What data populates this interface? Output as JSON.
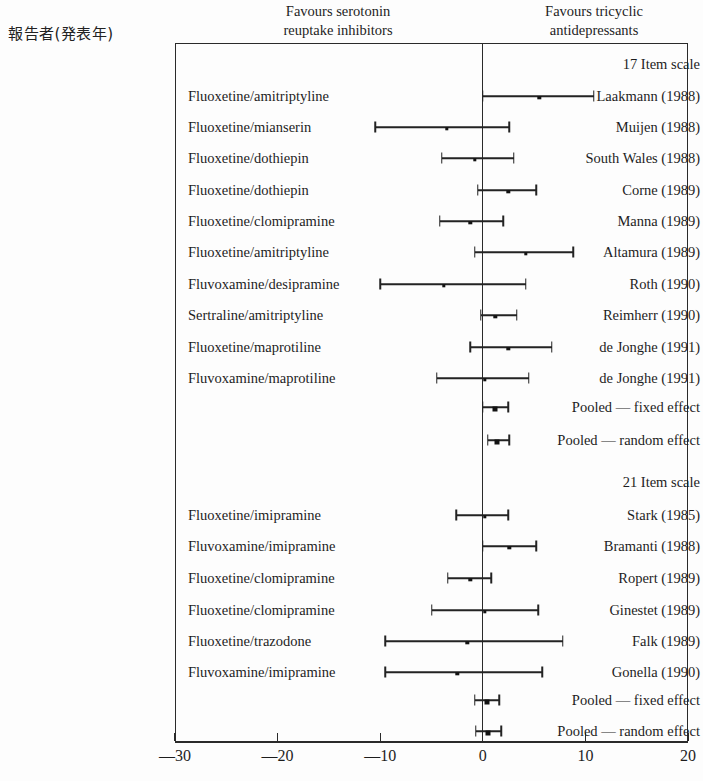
{
  "header": {
    "left_column_title": "報告者(発表年)",
    "favours_left": "Favours serotonin\nreuptake inhibitors",
    "favours_right": "Favours tricyclic\nantidepressants"
  },
  "axis": {
    "ticks": [
      -30,
      -20,
      -10,
      0,
      10,
      20
    ],
    "tick_labels": [
      "—30",
      "—20",
      "—10",
      "0",
      "10",
      "20"
    ],
    "min": -30,
    "max": 20
  },
  "chart_data": {
    "type": "forest",
    "title": "",
    "xlabel": "",
    "ylabel": "",
    "xlim": [
      -30,
      20
    ],
    "grid": false,
    "legend": "none",
    "annotations": {
      "left_side": "Favours serotonin reuptake inhibitors",
      "right_side": "Favours tricyclic antidepressants",
      "reference_line": 0
    },
    "groups": [
      {
        "group_label": "17 Item scale",
        "rows": [
          {
            "study": "Laakmann (1988)",
            "comparison": "Fluoxetine/amitriptyline",
            "estimate": 5.5,
            "ci_low": 0.0,
            "ci_high": 10.8,
            "kind": "study"
          },
          {
            "study": "Muijen (1988)",
            "comparison": "Fluoxetine/mianserin",
            "estimate": -3.5,
            "ci_low": -10.5,
            "ci_high": 2.6,
            "kind": "study"
          },
          {
            "study": "South Wales (1988)",
            "comparison": "Fluoxetine/dothiepin",
            "estimate": -0.8,
            "ci_low": -4.0,
            "ci_high": 3.0,
            "kind": "study"
          },
          {
            "study": "Corne (1989)",
            "comparison": "Fluoxetine/dothiepin",
            "estimate": 2.5,
            "ci_low": -0.5,
            "ci_high": 5.2,
            "kind": "study"
          },
          {
            "study": "Manna (1989)",
            "comparison": "Fluoxetine/clomipramine",
            "estimate": -1.2,
            "ci_low": -4.2,
            "ci_high": 2.0,
            "kind": "study"
          },
          {
            "study": "Altamura (1989)",
            "comparison": "Fluoxetine/amitriptyline",
            "estimate": 4.2,
            "ci_low": -0.8,
            "ci_high": 8.8,
            "kind": "study"
          },
          {
            "study": "Roth (1990)",
            "comparison": "Fluvoxamine/desipramine",
            "estimate": -3.8,
            "ci_low": -10.0,
            "ci_high": 4.2,
            "kind": "study"
          },
          {
            "study": "Reimherr (1990)",
            "comparison": "Sertraline/amitriptyline",
            "estimate": 1.2,
            "ci_low": -0.2,
            "ci_high": 3.3,
            "kind": "study"
          },
          {
            "study": "de Jonghe (1991)",
            "comparison": "Fluoxetine/maprotiline",
            "estimate": 2.5,
            "ci_low": -1.2,
            "ci_high": 6.7,
            "kind": "study"
          },
          {
            "study": "de Jonghe (1991)",
            "comparison": "Fluvoxamine/maprotiline",
            "estimate": 0.2,
            "ci_low": -4.5,
            "ci_high": 4.5,
            "kind": "study"
          },
          {
            "study": "Pooled — fixed effect",
            "comparison": "",
            "estimate": 1.2,
            "ci_low": 0.0,
            "ci_high": 2.5,
            "kind": "pooled"
          },
          {
            "study": "Pooled — random effect",
            "comparison": "",
            "estimate": 1.4,
            "ci_low": 0.5,
            "ci_high": 2.6,
            "kind": "pooled"
          }
        ]
      },
      {
        "group_label": "21 Item scale",
        "rows": [
          {
            "study": "Stark (1985)",
            "comparison": "Fluoxetine/imipramine",
            "estimate": 0.2,
            "ci_low": -2.6,
            "ci_high": 2.5,
            "kind": "study"
          },
          {
            "study": "Bramanti (1988)",
            "comparison": "Fluvoxamine/imipramine",
            "estimate": 2.6,
            "ci_low": 0.0,
            "ci_high": 5.2,
            "kind": "study"
          },
          {
            "study": "Ropert (1989)",
            "comparison": "Fluoxetine/clomipramine",
            "estimate": -1.2,
            "ci_low": -3.4,
            "ci_high": 0.8,
            "kind": "study"
          },
          {
            "study": "Ginestet (1989)",
            "comparison": "Fluoxetine/clomipramine",
            "estimate": 0.2,
            "ci_low": -5.0,
            "ci_high": 5.4,
            "kind": "study"
          },
          {
            "study": "Falk (1989)",
            "comparison": "Fluoxetine/trazodone",
            "estimate": -1.5,
            "ci_low": -9.5,
            "ci_high": 7.8,
            "kind": "study"
          },
          {
            "study": "Gonella (1990)",
            "comparison": "Fluvoxamine/imipramine",
            "estimate": -2.5,
            "ci_low": -9.5,
            "ci_high": 5.8,
            "kind": "study"
          },
          {
            "study": "Pooled — fixed effect",
            "comparison": "",
            "estimate": 0.4,
            "ci_low": -0.8,
            "ci_high": 1.6,
            "kind": "pooled"
          },
          {
            "study": "Pooled — random effect",
            "comparison": "",
            "estimate": 0.5,
            "ci_low": -0.7,
            "ci_high": 1.8,
            "kind": "pooled"
          }
        ]
      }
    ]
  },
  "layout": {
    "plot_left_px": 175,
    "plot_right_px": 688,
    "plot_top_px": 43,
    "axis_y_px": 741,
    "row_ys": [
      64,
      96,
      127,
      158,
      190,
      221,
      252,
      284,
      315,
      347,
      378,
      407,
      440,
      482,
      515,
      546,
      578,
      610,
      641,
      672,
      700,
      731
    ]
  },
  "colors": {
    "ink": "#232323",
    "background": "#fdfdfd"
  }
}
